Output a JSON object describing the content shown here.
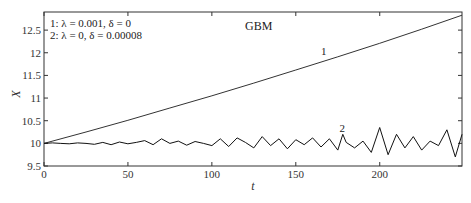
{
  "chart_data": {
    "type": "line",
    "title": "GBM",
    "xlabel": "t",
    "ylabel": "X",
    "xlim": [
      0,
      249
    ],
    "ylim": [
      9.5,
      12.9
    ],
    "xticks": [
      0,
      50,
      100,
      150,
      200
    ],
    "xtick_labels": [
      "0",
      "50",
      "100",
      "150",
      "200"
    ],
    "yticks": [
      9.5,
      10,
      10.5,
      11,
      11.5,
      12,
      12.5
    ],
    "ytick_labels": [
      "9.5",
      "10",
      "10.5",
      "11",
      "11.5",
      "12",
      "12.5"
    ],
    "grid": false,
    "legend": {
      "position": "upper left",
      "entries": [
        "1:  λ = 0.001, δ = 0",
        "2:  λ = 0, δ = 0.00008"
      ]
    },
    "series": [
      {
        "name": "1",
        "label_position": {
          "x": 165,
          "y": 11.95
        },
        "x": [
          0,
          25,
          50,
          75,
          100,
          125,
          150,
          175,
          200,
          225,
          249
        ],
        "y": [
          10.0,
          10.25,
          10.51,
          10.78,
          11.05,
          11.33,
          11.62,
          11.91,
          12.21,
          12.52,
          12.83
        ]
      },
      {
        "name": "2",
        "label_position": {
          "x": 176,
          "y": 10.25
        },
        "x": [
          0,
          5,
          10,
          15,
          20,
          25,
          30,
          35,
          40,
          45,
          50,
          55,
          60,
          65,
          70,
          75,
          80,
          85,
          90,
          95,
          100,
          105,
          110,
          115,
          120,
          125,
          130,
          135,
          140,
          145,
          150,
          155,
          160,
          165,
          170,
          175,
          178,
          180,
          185,
          190,
          195,
          200,
          205,
          210,
          215,
          220,
          225,
          230,
          235,
          240,
          245,
          249
        ],
        "y": [
          10.0,
          10.01,
          10.0,
          9.99,
          10.01,
          10.0,
          9.98,
          10.02,
          9.97,
          10.03,
          9.99,
          10.02,
          10.06,
          9.97,
          10.1,
          10.0,
          10.05,
          9.96,
          10.04,
          10.0,
          9.95,
          10.1,
          9.93,
          10.12,
          10.02,
          9.9,
          10.15,
          9.95,
          10.1,
          9.88,
          10.08,
          9.97,
          10.12,
          9.92,
          10.1,
          9.85,
          10.2,
          10.02,
          9.9,
          10.05,
          9.8,
          10.35,
          9.75,
          10.2,
          9.9,
          10.15,
          9.85,
          10.05,
          9.95,
          10.3,
          9.7,
          10.2
        ]
      }
    ],
    "caption": ""
  }
}
